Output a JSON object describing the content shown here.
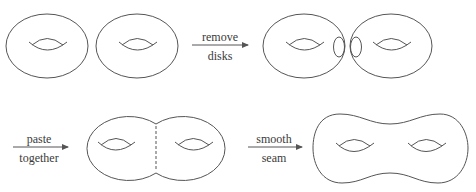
{
  "diagram": {
    "stroke_color": "#555555",
    "background": "#ffffff",
    "steps": [
      {
        "id": "remove-disks",
        "top_label": "remove",
        "bottom_label": "disks"
      },
      {
        "id": "paste-together",
        "top_label": "paste",
        "bottom_label": "together"
      },
      {
        "id": "smooth-seam",
        "top_label": "smooth",
        "bottom_label": "seam"
      }
    ],
    "figures": [
      {
        "id": "torus-a",
        "row": 1,
        "kind": "torus"
      },
      {
        "id": "torus-b",
        "row": 1,
        "kind": "torus"
      },
      {
        "id": "torus-a-disk-removed",
        "row": 1,
        "kind": "torus-with-disk"
      },
      {
        "id": "torus-b-disk-removed",
        "row": 1,
        "kind": "torus-with-disk"
      },
      {
        "id": "pasted-tori",
        "row": 2,
        "kind": "glued-tori"
      },
      {
        "id": "genus-two-surface",
        "row": 2,
        "kind": "double-torus"
      }
    ]
  }
}
